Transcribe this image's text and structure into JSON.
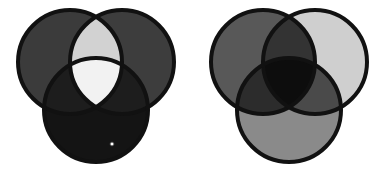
{
  "figure": {
    "background_color": "#ffffff",
    "width": 386,
    "height": 179,
    "outline_color": "#111111",
    "outline_width": 4,
    "circle_radius": 52,
    "panels": [
      {
        "id": "left-panel",
        "name": "subtractive-venn",
        "label": "Subtractive colour mixing diagram",
        "center_x": 96,
        "center_y": 86,
        "circles": [
          {
            "id": "top-left",
            "name": "circle-top-left",
            "cx": 70,
            "cy": 62,
            "fill": "#3b3b3b"
          },
          {
            "id": "top-right",
            "name": "circle-top-right",
            "cx": 122,
            "cy": 62,
            "fill": "#3d3d3d"
          },
          {
            "id": "bottom",
            "name": "circle-bottom",
            "cx": 96,
            "cy": 110,
            "fill": "#141414"
          }
        ],
        "regions": [
          {
            "id": "left-only",
            "name": "region-top-left-only",
            "fill": "#3b3b3b"
          },
          {
            "id": "right-only",
            "name": "region-top-right-only",
            "fill": "#3d3d3d"
          },
          {
            "id": "bottom-only",
            "name": "region-bottom-only",
            "fill": "#141414"
          },
          {
            "id": "lens-top",
            "name": "region-top-pair-overlap",
            "fill": "#d2d2d2"
          },
          {
            "id": "lens-left",
            "name": "region-left-pair-overlap",
            "fill": "#1d1d1d"
          },
          {
            "id": "lens-right",
            "name": "region-right-pair-overlap",
            "fill": "#1d1d1d"
          },
          {
            "id": "center",
            "name": "region-triple-overlap",
            "fill": "#f2f2f2"
          }
        ],
        "marker": {
          "name": "reference-dot-marker",
          "cx": 112,
          "cy": 144,
          "radius": 2.1,
          "fill": "#ffffff",
          "stroke": "#2a2a2a"
        }
      },
      {
        "id": "right-panel",
        "name": "additive-venn",
        "label": "Additive colour mixing diagram",
        "center_x": 289,
        "center_y": 86,
        "circles": [
          {
            "id": "top-left",
            "name": "circle-top-left",
            "cx": 263,
            "cy": 62,
            "fill": "#585858"
          },
          {
            "id": "top-right",
            "name": "circle-top-right",
            "cx": 315,
            "cy": 62,
            "fill": "#cfcfcf"
          },
          {
            "id": "bottom",
            "name": "circle-bottom",
            "cx": 289,
            "cy": 110,
            "fill": "#8a8a8a"
          }
        ],
        "regions": [
          {
            "id": "left-only",
            "name": "region-top-left-only",
            "fill": "#585858"
          },
          {
            "id": "right-only",
            "name": "region-top-right-only",
            "fill": "#cfcfcf"
          },
          {
            "id": "bottom-only",
            "name": "region-bottom-only",
            "fill": "#8a8a8a"
          },
          {
            "id": "lens-top",
            "name": "region-top-pair-overlap",
            "fill": "#333333"
          },
          {
            "id": "lens-left",
            "name": "region-left-pair-overlap",
            "fill": "#2c2c2c"
          },
          {
            "id": "lens-right",
            "name": "region-right-pair-overlap",
            "fill": "#4a4a4a"
          },
          {
            "id": "center",
            "name": "region-triple-overlap",
            "fill": "#0d0d0d"
          }
        ],
        "marker": null
      }
    ]
  }
}
